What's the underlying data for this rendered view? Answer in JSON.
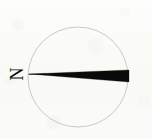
{
  "figure": {
    "kind": "rose-diagram",
    "title": "",
    "background_color": "#fcfcfa",
    "ink_color": "#0a0a0a",
    "outline_color": "#b8b8b8"
  },
  "labels": {
    "north": "N",
    "north_rotation_degrees": -90
  },
  "circle": {
    "center_x": 78,
    "center_y": 77,
    "radius": 50,
    "stroke_color": "#bcbcbc",
    "stroke_width": 0.8,
    "fill": "none"
  },
  "chart_data": {
    "type": "bar",
    "title": "",
    "subtitle": "",
    "xlabel": "",
    "ylabel": "",
    "grid": false,
    "legend_position": "none",
    "axis_labels": [
      "N"
    ],
    "categories": [
      "E"
    ],
    "values": [
      100
    ],
    "series": [
      {
        "name": "orientation-wedge",
        "values": [
          100
        ]
      }
    ],
    "annotations": [
      {
        "text": "N",
        "x": 16,
        "y": 76,
        "rotation": -90
      }
    ],
    "wedge": {
      "apex_x": 29,
      "apex_y": 74,
      "outer_top_x": 129,
      "outer_top_y": 70,
      "outer_bottom_x": 129,
      "outer_bottom_y": 82,
      "fill_color": "#0a0a0a",
      "direction_degrees": 90,
      "spread_degrees": 7
    }
  }
}
